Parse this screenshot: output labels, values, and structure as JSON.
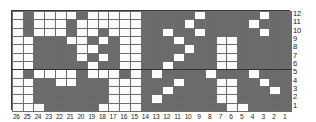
{
  "chart_data": {
    "type": "heatmap",
    "title": "",
    "xlabel": "",
    "ylabel": "",
    "columns": 26,
    "rows": 12,
    "col_labels": [
      "26",
      "25",
      "24",
      "23",
      "22",
      "21",
      "20",
      "19",
      "18",
      "17",
      "16",
      "15",
      "14",
      "13",
      "12",
      "11",
      "10",
      "9",
      "8",
      "7",
      "6",
      "5",
      "4",
      "3",
      "2",
      "1"
    ],
    "row_labels": [
      "12",
      "11",
      "10",
      "9",
      "8",
      "7",
      "6",
      "5",
      "4",
      "3",
      "2",
      "1"
    ],
    "col_order": "right-to-left",
    "row_order": "bottom-to-top",
    "colors": {
      "filled": "#6b6b6b",
      "empty": "#fbfbfb",
      "grid_line": "#6e6e6e",
      "border": "#3a3a3a",
      "label_text": "#1c1c1c"
    },
    "legend": [],
    "grid": true,
    "cells_top_to_bottom": [
      [
        0,
        1,
        0,
        0,
        0,
        0,
        1,
        0,
        0,
        0,
        0,
        0,
        1,
        1,
        1,
        1,
        1,
        0,
        1,
        1,
        1,
        1,
        1,
        0,
        1,
        1
      ],
      [
        0,
        1,
        0,
        0,
        0,
        1,
        0,
        0,
        0,
        0,
        0,
        0,
        1,
        1,
        1,
        1,
        0,
        1,
        1,
        1,
        1,
        1,
        0,
        1,
        1,
        1
      ],
      [
        0,
        1,
        0,
        0,
        0,
        1,
        0,
        0,
        1,
        0,
        0,
        0,
        1,
        1,
        0,
        1,
        1,
        0,
        1,
        1,
        1,
        1,
        1,
        0,
        1,
        1
      ],
      [
        0,
        0,
        1,
        1,
        1,
        0,
        0,
        1,
        0,
        1,
        0,
        0,
        1,
        1,
        1,
        0,
        1,
        1,
        1,
        0,
        0,
        1,
        1,
        1,
        1,
        1
      ],
      [
        0,
        0,
        1,
        1,
        1,
        1,
        0,
        0,
        1,
        1,
        0,
        0,
        1,
        1,
        1,
        1,
        0,
        1,
        1,
        0,
        0,
        1,
        1,
        1,
        1,
        1
      ],
      [
        0,
        0,
        1,
        1,
        1,
        1,
        0,
        1,
        0,
        1,
        0,
        0,
        1,
        1,
        1,
        0,
        1,
        1,
        1,
        0,
        0,
        1,
        1,
        1,
        1,
        1
      ],
      [
        0,
        0,
        1,
        1,
        1,
        1,
        1,
        0,
        1,
        1,
        0,
        0,
        1,
        1,
        0,
        1,
        1,
        1,
        1,
        0,
        0,
        1,
        1,
        1,
        1,
        1
      ],
      [
        0,
        1,
        0,
        0,
        0,
        0,
        1,
        0,
        0,
        0,
        1,
        0,
        1,
        0,
        1,
        1,
        1,
        1,
        0,
        1,
        1,
        1,
        0,
        1,
        1,
        1
      ],
      [
        0,
        0,
        1,
        1,
        0,
        0,
        1,
        1,
        1,
        0,
        0,
        0,
        1,
        1,
        1,
        0,
        1,
        1,
        1,
        0,
        0,
        1,
        1,
        0,
        1,
        1
      ],
      [
        0,
        0,
        1,
        1,
        1,
        1,
        1,
        1,
        1,
        0,
        0,
        0,
        1,
        1,
        0,
        1,
        1,
        1,
        1,
        0,
        0,
        1,
        1,
        1,
        0,
        1
      ],
      [
        0,
        0,
        1,
        1,
        1,
        1,
        1,
        1,
        1,
        0,
        0,
        0,
        1,
        0,
        1,
        1,
        1,
        1,
        1,
        0,
        0,
        1,
        1,
        1,
        1,
        1
      ],
      [
        0,
        0,
        0,
        1,
        1,
        1,
        1,
        1,
        0,
        0,
        0,
        0,
        1,
        1,
        1,
        1,
        1,
        1,
        1,
        1,
        0,
        0,
        1,
        1,
        1,
        1
      ]
    ],
    "heavy_column_separators_after_index": [
      5,
      12,
      19
    ],
    "heavy_row_separator_after_index": [
      6
    ]
  }
}
